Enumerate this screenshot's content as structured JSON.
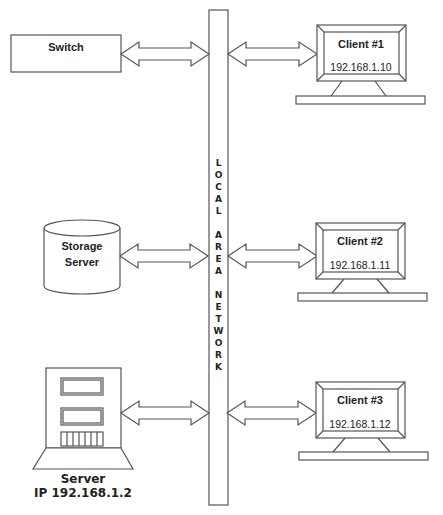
{
  "diagram": {
    "lan": {
      "label": "LOCAL AREA NETWORK",
      "letters": [
        "L",
        "O",
        "C",
        "A",
        "L",
        "",
        "A",
        "R",
        "E",
        "A",
        "",
        "N",
        "E",
        "T",
        "W",
        "O",
        "R",
        "K"
      ]
    },
    "switch": {
      "label": "Switch"
    },
    "storage": {
      "line1": "Storage",
      "line2": "Server"
    },
    "server": {
      "name": "Server",
      "ip": "IP 192.168.1.2"
    },
    "clients": [
      {
        "name": "Client #1",
        "ip": "192.168.1.10"
      },
      {
        "name": "Client #2",
        "ip": "192.168.1.11"
      },
      {
        "name": "Client #3",
        "ip": "192.168.1.12"
      }
    ],
    "colors": {
      "stroke": "#555555",
      "text": "#222222",
      "background": "#ffffff"
    }
  }
}
